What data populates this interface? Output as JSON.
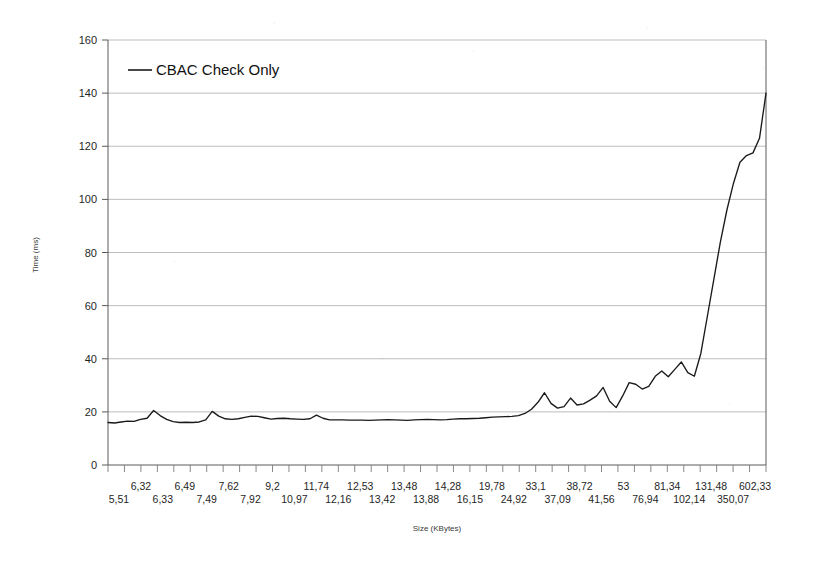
{
  "chart_data": {
    "type": "line",
    "title": "",
    "xlabel": "Size (KBytes)",
    "ylabel": "Time (ms)",
    "ylim": [
      0,
      160
    ],
    "ytick_step": 20,
    "yticks": [
      0,
      20,
      40,
      60,
      80,
      100,
      120,
      140,
      160
    ],
    "grid": "horizontal",
    "legend_position": "top-left-inside",
    "decimal_separator": ",",
    "legend": [
      "CBAC Check Only"
    ],
    "series": [
      {
        "name": "CBAC Check Only",
        "color": "#1a1a1a",
        "values": [
          16.0,
          15.8,
          16.2,
          16.5,
          16.4,
          17.2,
          17.6,
          20.5,
          18.6,
          17.2,
          16.3,
          16.0,
          16.1,
          16.0,
          16.2,
          17.0,
          20.2,
          18.4,
          17.4,
          17.2,
          17.4,
          17.9,
          18.4,
          18.3,
          17.8,
          17.3,
          17.5,
          17.6,
          17.4,
          17.3,
          17.2,
          17.4,
          18.8,
          17.6,
          17.0,
          17.0,
          17.0,
          16.9,
          16.9,
          16.9,
          16.8,
          16.9,
          17.0,
          17.1,
          17.0,
          16.9,
          16.8,
          17.0,
          17.1,
          17.2,
          17.1,
          17.0,
          17.1,
          17.3,
          17.4,
          17.4,
          17.5,
          17.6,
          17.8,
          18.0,
          18.1,
          18.2,
          18.3,
          18.6,
          19.4,
          21.0,
          23.6,
          27.2,
          23.2,
          21.4,
          22.0,
          25.2,
          22.6,
          23.0,
          24.4,
          26.0,
          29.2,
          24.0,
          21.6,
          26.0,
          31.0,
          30.4,
          28.6,
          29.6,
          33.4,
          35.4,
          33.2,
          36.0,
          38.8,
          34.8,
          33.4,
          42.0,
          56.0,
          70.0,
          84.0,
          96.0,
          106.0,
          114.0,
          116.5,
          117.5,
          123.0,
          140.0
        ],
        "x_labels_row_top": [
          "6,32",
          "6,49",
          "7,62",
          "9,2",
          "11,74",
          "12,53",
          "13,48",
          "14,28",
          "19,78",
          "33,1",
          "38,72",
          "53",
          "81,34",
          "131,48",
          "602,33"
        ],
        "x_labels_row_bottom": [
          "5,51",
          "6,33",
          "7,49",
          "7,92",
          "10,97",
          "12,16",
          "13,42",
          "13,88",
          "16,15",
          "24,92",
          "37,09",
          "41,56",
          "76,94",
          "102,14",
          "350,07"
        ],
        "x_labels_interleaved": [
          "5,51",
          "6,32",
          "6,33",
          "6,49",
          "7,49",
          "7,62",
          "7,92",
          "9,2",
          "10,97",
          "11,74",
          "12,16",
          "12,53",
          "13,42",
          "13,48",
          "13,88",
          "14,28",
          "16,15",
          "19,78",
          "24,92",
          "33,1",
          "37,09",
          "38,72",
          "41,56",
          "53",
          "76,94",
          "81,34",
          "102,14",
          "131,48",
          "350,07",
          "602,33"
        ]
      }
    ]
  }
}
